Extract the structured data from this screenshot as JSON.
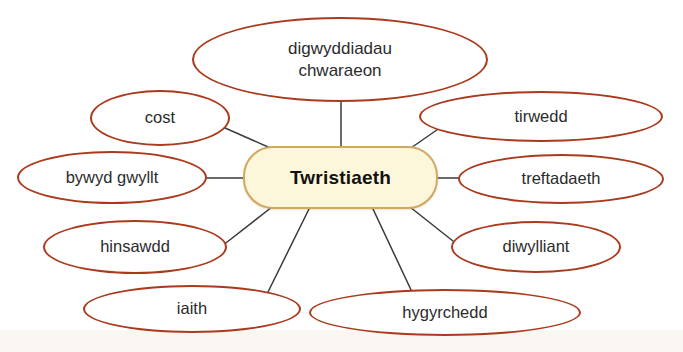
{
  "page": {
    "clipped_heading": "",
    "background_color": "#ffffff"
  },
  "colors": {
    "ellipse_stroke": "#ab3a1d",
    "ellipse_fill": "#ffffff",
    "central_fill": "#fcf6db",
    "central_stroke": "#d2a860",
    "connector": "#3a3a3c",
    "text": "#2b2b2b",
    "central_text": "#111111"
  },
  "diagram": {
    "type": "mind-map",
    "title": "Twristiaeth",
    "central": {
      "label": "Twristiaeth"
    },
    "branches": [
      {
        "id": "digwyddiadau-chwaraeon",
        "label": "digwyddiadau chwaraeon",
        "line1": "digwyddiadau",
        "line2": "chwaraeon"
      },
      {
        "id": "cost",
        "label": "cost"
      },
      {
        "id": "tirwedd",
        "label": "tirwedd"
      },
      {
        "id": "bywyd-gwyllt",
        "label": "bywyd gwyllt"
      },
      {
        "id": "treftadaeth",
        "label": "treftadaeth"
      },
      {
        "id": "hinsawdd",
        "label": "hinsawdd"
      },
      {
        "id": "diwylliant",
        "label": "diwylliant"
      },
      {
        "id": "iaith",
        "label": "iaith"
      },
      {
        "id": "hygyrchedd",
        "label": "hygyrchedd"
      }
    ]
  }
}
